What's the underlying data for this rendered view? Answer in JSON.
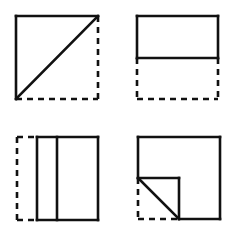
{
  "diagram": {
    "colors": {
      "stroke": "#111111",
      "background": "#ffffff"
    },
    "figures": [
      {
        "id": "fold-diagonal",
        "position": "top-left",
        "fold_type": "diagonal fold bottom-right corner onto top-left",
        "solid_segments": [
          [
            16,
            16,
            98,
            16
          ],
          [
            16,
            16,
            16,
            99
          ],
          [
            16,
            99,
            98,
            16
          ]
        ],
        "dashed_segments": [
          [
            98,
            16,
            98,
            99
          ],
          [
            16,
            99,
            98,
            99
          ]
        ]
      },
      {
        "id": "fold-horizontal",
        "position": "top-right",
        "fold_type": "bottom half folded up",
        "solid_segments": [
          [
            137,
            16,
            218,
            16
          ],
          [
            137,
            16,
            137,
            58
          ],
          [
            218,
            16,
            218,
            58
          ],
          [
            137,
            58,
            218,
            58
          ]
        ],
        "dashed_segments": [
          [
            137,
            58,
            137,
            99
          ],
          [
            218,
            58,
            218,
            99
          ],
          [
            137,
            99,
            218,
            99
          ]
        ]
      },
      {
        "id": "fold-vertical",
        "position": "bottom-left",
        "fold_type": "left strip folded right",
        "solid_segments": [
          [
            37,
            137,
            98,
            137
          ],
          [
            37,
            137,
            37,
            220
          ],
          [
            98,
            137,
            98,
            220
          ],
          [
            37,
            220,
            98,
            220
          ],
          [
            57,
            137,
            57,
            220
          ]
        ],
        "dashed_segments": [
          [
            17,
            137,
            37,
            137
          ],
          [
            17,
            137,
            17,
            220
          ],
          [
            17,
            220,
            37,
            220
          ]
        ]
      },
      {
        "id": "fold-corner",
        "position": "bottom-right",
        "fold_type": "bottom-left corner folded in",
        "solid_segments": [
          [
            138,
            137,
            220,
            137
          ],
          [
            220,
            137,
            220,
            219
          ],
          [
            138,
            137,
            138,
            178
          ],
          [
            179,
            219,
            220,
            219
          ],
          [
            138,
            178,
            179,
            178
          ],
          [
            179,
            178,
            179,
            219
          ],
          [
            138,
            178,
            179,
            219
          ]
        ],
        "dashed_segments": [
          [
            138,
            178,
            138,
            219
          ],
          [
            138,
            219,
            179,
            219
          ]
        ]
      }
    ]
  }
}
